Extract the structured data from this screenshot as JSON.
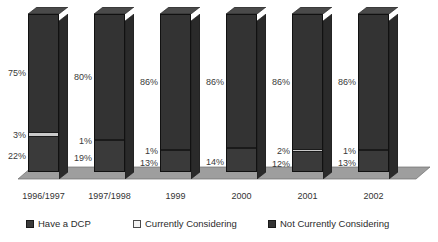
{
  "chart_data": {
    "type": "bar",
    "subtype": "stacked-column-3d",
    "title": "",
    "xlabel": "",
    "ylabel": "",
    "ylim": [
      0,
      100
    ],
    "grid": false,
    "legend_position": "bottom",
    "stacked": true,
    "stack_order_bottom_to_top": [
      "Have a DCP",
      "Currently Considering",
      "Not Currently Considering"
    ],
    "categories": [
      "1996/1997",
      "1997/1998",
      "1999",
      "2000",
      "2001",
      "2002"
    ],
    "series": [
      {
        "name": "Have a DCP",
        "values": [
          22,
          19,
          13,
          14,
          12,
          13
        ],
        "labels": [
          "22%",
          "19%",
          "13%",
          "14%",
          "12%",
          "13%"
        ],
        "color": "#3a3a3a"
      },
      {
        "name": "Currently Considering",
        "values": [
          3,
          1,
          1,
          0,
          2,
          1
        ],
        "labels": [
          "3%",
          "1%",
          "1%",
          "",
          "2%",
          "1%"
        ],
        "color": "#c9c9c9"
      },
      {
        "name": "Not Currently Considering",
        "values": [
          75,
          80,
          86,
          86,
          86,
          86
        ],
        "labels": [
          "75%",
          "80%",
          "86%",
          "86%",
          "86%",
          "86%"
        ],
        "color": "#333333"
      }
    ]
  },
  "legend": {
    "items": [
      {
        "label": "Have a DCP",
        "swatch": "dark-filled-square"
      },
      {
        "label": "Currently Considering",
        "swatch": "light-outlined-square"
      },
      {
        "label": "Not Currently Considering",
        "swatch": "dark-filled-square"
      }
    ]
  },
  "axis": {
    "categories": [
      "1996/1997",
      "1997/1998",
      "1999",
      "2000",
      "2001",
      "2002"
    ]
  },
  "colors": {
    "have_a_dcp": "#3a3a3a",
    "currently_considering": "#c9c9c9",
    "not_currently_considering": "#333333",
    "floor": "#9a9a9a",
    "background": "#ffffff",
    "text": "#2b2b2b"
  }
}
